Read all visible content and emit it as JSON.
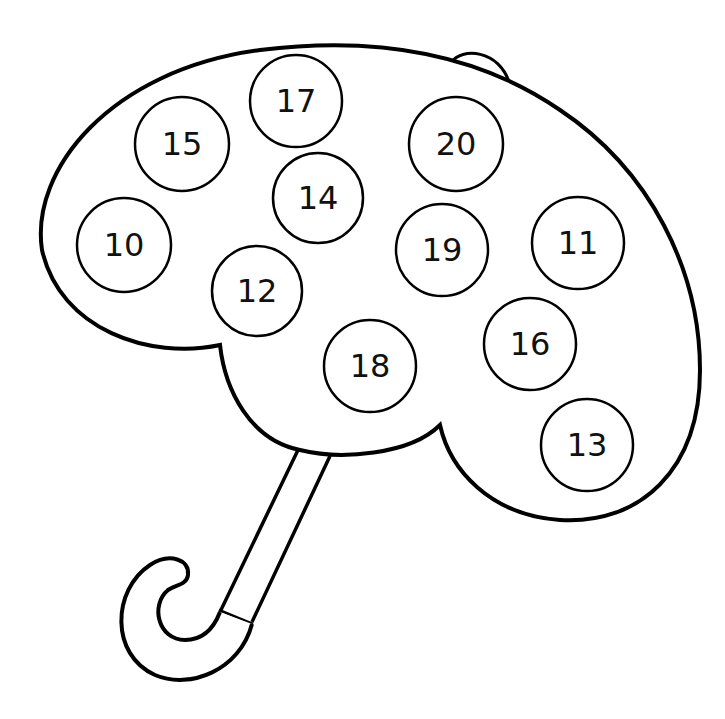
{
  "worksheet": {
    "subject": "umbrella number circles",
    "colors": {
      "line": "#000000",
      "background": "#ffffff"
    },
    "circles": [
      {
        "label": "17",
        "cx": 296,
        "cy": 101,
        "r": 46
      },
      {
        "label": "15",
        "cx": 182,
        "cy": 144,
        "r": 47
      },
      {
        "label": "20",
        "cx": 456,
        "cy": 144,
        "r": 47
      },
      {
        "label": "14",
        "cx": 318,
        "cy": 198,
        "r": 45
      },
      {
        "label": "10",
        "cx": 124,
        "cy": 245,
        "r": 47
      },
      {
        "label": "19",
        "cx": 442,
        "cy": 250,
        "r": 46
      },
      {
        "label": "11",
        "cx": 578,
        "cy": 243,
        "r": 46
      },
      {
        "label": "12",
        "cx": 257,
        "cy": 291,
        "r": 45
      },
      {
        "label": "18",
        "cx": 370,
        "cy": 366,
        "r": 46
      },
      {
        "label": "16",
        "cx": 530,
        "cy": 344,
        "r": 46
      },
      {
        "label": "13",
        "cx": 587,
        "cy": 445,
        "r": 46
      }
    ]
  }
}
